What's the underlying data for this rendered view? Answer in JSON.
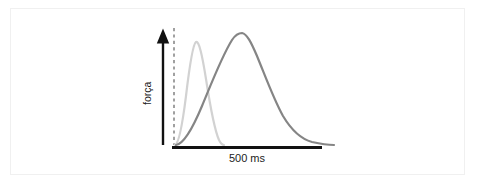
{
  "figure": {
    "background_color": "#ffffff",
    "frame_color": "#f0f0f0",
    "y_axis_label": "força",
    "scale_bar_label": "500 ms"
  },
  "chart_data": {
    "type": "line",
    "title": "",
    "subtitle": "",
    "xlabel": "",
    "ylabel": "força",
    "annotations": [
      {
        "name": "scale-bar",
        "label": "500 ms",
        "orientation": "horizontal",
        "x_start": 172,
        "x_end": 322,
        "y": 147,
        "color": "#111111"
      },
      {
        "name": "y-axis-arrow",
        "label": "força",
        "orientation": "vertical-up",
        "x": 163,
        "y_start": 145,
        "y_end": 30,
        "color": "#111111"
      },
      {
        "name": "stimulus-onset-line",
        "label": "",
        "style": "dashed",
        "x": 174,
        "y_start": 28,
        "y_end": 145,
        "color": "#6e6e6e"
      }
    ],
    "axis_ranges": {
      "x": [
        172,
        340
      ],
      "y": [
        0,
        1
      ]
    },
    "grid": false,
    "legend_position": "none",
    "units": {
      "x": "ms",
      "y": "arbitrary (force)"
    },
    "series": [
      {
        "name": "fast-twitch-light-curve",
        "color": "#d2d2d2",
        "stroke_width": 2.2,
        "peak_x": 196,
        "peak_y": 42,
        "onset_x": 175,
        "offset_x": 224,
        "description": "narrow early force peak",
        "path": "M 175,145 C 178,144 182,128 186,96 C 190,62 193,44 196,42 C 199,41 202,54 206,79 C 210,105 215,131 219,140 C 221,144 223,145 224,145"
      },
      {
        "name": "slow-twitch-dark-curve",
        "color": "#858585",
        "stroke_width": 2.2,
        "peak_x": 240,
        "peak_y": 33,
        "onset_x": 176,
        "offset_x": 334,
        "description": "broad late force peak with long decay tail",
        "path": "M 176,145 C 183,144 192,130 202,106 C 212,82 222,56 232,40 C 236,34 239,33 242,33 C 247,34 251,42 257,56 C 266,78 274,100 283,116 C 292,131 301,139 312,142 C 321,144 328,145 334,145"
      }
    ]
  }
}
